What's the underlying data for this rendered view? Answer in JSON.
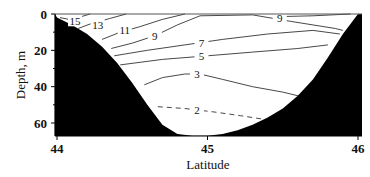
{
  "chart_data": {
    "type": "contour",
    "title": "",
    "xlabel": "Latitude",
    "ylabel": "Depth, m",
    "xlim": [
      44,
      46
    ],
    "ylim": [
      67,
      0
    ],
    "y_inverted": true,
    "x_ticks": [
      44,
      45,
      46
    ],
    "y_ticks": [
      0,
      20,
      40,
      60
    ],
    "grid": false,
    "legend": null,
    "bathymetry_fill": "#000000",
    "bathymetry": {
      "lat": [
        44.0,
        44.1,
        44.2,
        44.3,
        44.4,
        44.5,
        44.6,
        44.7,
        44.8,
        44.9,
        45.0,
        45.1,
        45.2,
        45.3,
        45.4,
        45.5,
        45.6,
        45.7,
        45.8,
        45.9,
        46.0
      ],
      "depth": [
        2,
        6,
        11,
        18,
        27,
        38,
        50,
        61,
        66,
        67,
        67,
        66,
        64,
        61,
        57,
        52,
        45,
        36,
        24,
        11,
        0
      ]
    },
    "contours": [
      {
        "level": 15,
        "style": "solid",
        "label_lat": 44.12,
        "label_depth": 4,
        "points": [
          [
            44.02,
            2
          ],
          [
            44.08,
            3
          ],
          [
            44.16,
            1.5
          ],
          [
            44.22,
            0
          ]
        ]
      },
      {
        "level": 13,
        "style": "solid",
        "label_lat": 44.27,
        "label_depth": 6,
        "points": [
          [
            44.14,
            8
          ],
          [
            44.22,
            5.5
          ],
          [
            44.35,
            2.5
          ],
          [
            44.46,
            0
          ]
        ]
      },
      {
        "level": 11,
        "style": "solid",
        "label_lat": 44.45,
        "label_depth": 9,
        "points": [
          [
            44.3,
            14
          ],
          [
            44.42,
            10
          ],
          [
            44.55,
            7
          ],
          [
            44.7,
            3
          ],
          [
            44.85,
            0
          ]
        ]
      },
      {
        "level": 9,
        "style": "solid",
        "label_lat": 44.65,
        "label_depth": 12,
        "points": [
          [
            44.36,
            19
          ],
          [
            44.5,
            16
          ],
          [
            44.65,
            12
          ],
          [
            44.8,
            6
          ],
          [
            44.95,
            1
          ],
          [
            45.3,
            0.5
          ],
          [
            45.55,
            4
          ],
          [
            45.85,
            8
          ],
          [
            45.9,
            9
          ]
        ]
      },
      {
        "level": 9,
        "style": "solid",
        "label_lat": 45.48,
        "label_depth": 2,
        "points": [
          [
            45.95,
            0
          ],
          [
            45.7,
            1
          ],
          [
            45.45,
            1.5
          ]
        ]
      },
      {
        "level": 7,
        "style": "solid",
        "label_lat": 44.96,
        "label_depth": 16,
        "points": [
          [
            44.38,
            23
          ],
          [
            44.6,
            20
          ],
          [
            44.85,
            17
          ],
          [
            45.1,
            14
          ],
          [
            45.4,
            11
          ],
          [
            45.7,
            9
          ],
          [
            45.88,
            11
          ]
        ]
      },
      {
        "level": 5,
        "style": "solid",
        "label_lat": 44.96,
        "label_depth": 23,
        "points": [
          [
            44.42,
            28
          ],
          [
            44.7,
            25
          ],
          [
            45.0,
            23
          ],
          [
            45.3,
            21
          ],
          [
            45.6,
            19
          ],
          [
            45.8,
            17
          ]
        ]
      },
      {
        "level": 3,
        "style": "solid",
        "label_lat": 44.93,
        "label_depth": 33,
        "points": [
          [
            44.58,
            39
          ],
          [
            44.7,
            35
          ],
          [
            44.85,
            33
          ],
          [
            44.95,
            33
          ],
          [
            45.1,
            36
          ],
          [
            45.3,
            40
          ],
          [
            45.5,
            43
          ],
          [
            45.65,
            46
          ]
        ]
      },
      {
        "level": 2,
        "style": "dashed",
        "label_lat": 44.93,
        "label_depth": 53,
        "points": [
          [
            44.67,
            51
          ],
          [
            44.85,
            52
          ],
          [
            45.05,
            54
          ],
          [
            45.22,
            56
          ],
          [
            45.38,
            58
          ]
        ]
      }
    ]
  }
}
